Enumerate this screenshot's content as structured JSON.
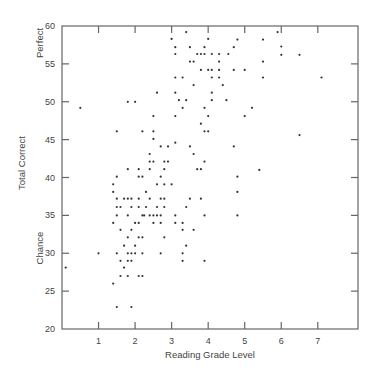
{
  "chart_data": {
    "type": "scatter",
    "title": "",
    "xlabel": "Reading Grade Level",
    "ylabel": "Total Correct",
    "y_annotations": [
      {
        "label": "Perfect",
        "y": 58
      },
      {
        "label": "Chance",
        "y": 30
      }
    ],
    "xlim": [
      0,
      8.1
    ],
    "ylim": [
      20,
      60
    ],
    "x_ticks": [
      1,
      2,
      3,
      4,
      5,
      6,
      7
    ],
    "y_ticks": [
      20,
      25,
      30,
      35,
      40,
      45,
      50,
      55,
      60
    ],
    "grid": false,
    "legend": null,
    "points": [
      [
        3.4,
        59.2
      ],
      [
        3.0,
        58.3
      ],
      [
        4.0,
        58.3
      ],
      [
        4.8,
        58.2
      ],
      [
        5.9,
        59.2
      ],
      [
        5.5,
        58.2
      ],
      [
        3.1,
        57.2
      ],
      [
        3.5,
        57.2
      ],
      [
        3.9,
        57.2
      ],
      [
        4.7,
        57.2
      ],
      [
        6.0,
        57.3
      ],
      [
        3.1,
        56.3
      ],
      [
        3.7,
        56.3
      ],
      [
        3.8,
        56.3
      ],
      [
        3.9,
        56.3
      ],
      [
        4.1,
        56.3
      ],
      [
        4.3,
        56.3
      ],
      [
        4.55,
        56.3
      ],
      [
        6.0,
        56.2
      ],
      [
        6.5,
        56.2
      ],
      [
        3.5,
        55.3
      ],
      [
        3.6,
        55.3
      ],
      [
        4.3,
        55.3
      ],
      [
        5.5,
        55.3
      ],
      [
        3.8,
        54.2
      ],
      [
        4.0,
        54.2
      ],
      [
        4.1,
        54.2
      ],
      [
        4.3,
        54.2
      ],
      [
        4.7,
        54.2
      ],
      [
        5.0,
        54.2
      ],
      [
        3.1,
        53.2
      ],
      [
        3.3,
        53.2
      ],
      [
        4.1,
        53.2
      ],
      [
        4.3,
        53.2
      ],
      [
        5.5,
        53.2
      ],
      [
        7.1,
        53.2
      ],
      [
        3.6,
        52.2
      ],
      [
        4.4,
        52.2
      ],
      [
        2.6,
        51.2
      ],
      [
        3.1,
        51.2
      ],
      [
        4.1,
        51.2
      ],
      [
        1.8,
        50.0
      ],
      [
        2.0,
        50.0
      ],
      [
        3.2,
        50.2
      ],
      [
        3.4,
        50.2
      ],
      [
        4.1,
        50.2
      ],
      [
        4.5,
        50.2
      ],
      [
        0.5,
        49.2
      ],
      [
        3.3,
        49.2
      ],
      [
        3.9,
        49.2
      ],
      [
        5.2,
        49.2
      ],
      [
        2.5,
        48.1
      ],
      [
        3.1,
        48.1
      ],
      [
        4.0,
        48.1
      ],
      [
        5.0,
        48.1
      ],
      [
        3.8,
        47.1
      ],
      [
        1.5,
        46.1
      ],
      [
        2.2,
        46.1
      ],
      [
        2.5,
        46.1
      ],
      [
        3.9,
        46.1
      ],
      [
        4.0,
        46.1
      ],
      [
        2.5,
        45.1
      ],
      [
        6.5,
        45.6
      ],
      [
        3.1,
        44.6
      ],
      [
        2.7,
        44.1
      ],
      [
        2.9,
        44.1
      ],
      [
        3.5,
        44.1
      ],
      [
        4.7,
        44.1
      ],
      [
        2.4,
        43.1
      ],
      [
        3.6,
        43.1
      ],
      [
        2.4,
        42.1
      ],
      [
        2.5,
        42.1
      ],
      [
        2.8,
        42.1
      ],
      [
        2.9,
        42.1
      ],
      [
        3.9,
        42.1
      ],
      [
        1.8,
        41.1
      ],
      [
        2.1,
        41.1
      ],
      [
        2.4,
        41.1
      ],
      [
        2.8,
        41.1
      ],
      [
        3.7,
        41.1
      ],
      [
        3.8,
        41.1
      ],
      [
        5.4,
        41.0
      ],
      [
        1.5,
        40.1
      ],
      [
        2.1,
        40.1
      ],
      [
        2.2,
        40.1
      ],
      [
        2.7,
        40.1
      ],
      [
        4.8,
        40.1
      ],
      [
        1.4,
        39.1
      ],
      [
        2.6,
        39.1
      ],
      [
        2.8,
        39.1
      ],
      [
        3.0,
        39.1
      ],
      [
        1.4,
        38.1
      ],
      [
        2.3,
        38.1
      ],
      [
        4.8,
        38.1
      ],
      [
        1.5,
        37.2
      ],
      [
        1.7,
        37.2
      ],
      [
        1.8,
        37.2
      ],
      [
        1.9,
        37.2
      ],
      [
        2.1,
        37.2
      ],
      [
        2.4,
        37.2
      ],
      [
        2.7,
        37.2
      ],
      [
        2.8,
        37.2
      ],
      [
        3.5,
        37.2
      ],
      [
        3.8,
        37.2
      ],
      [
        1.5,
        36.1
      ],
      [
        1.6,
        36.1
      ],
      [
        1.9,
        36.1
      ],
      [
        2.1,
        36.1
      ],
      [
        2.3,
        36.1
      ],
      [
        2.6,
        36.1
      ],
      [
        2.8,
        36.1
      ],
      [
        3.4,
        36.1
      ],
      [
        1.5,
        35.0
      ],
      [
        1.8,
        35.0
      ],
      [
        2.2,
        35.0
      ],
      [
        2.25,
        35.0
      ],
      [
        2.4,
        35.0
      ],
      [
        2.5,
        35.0
      ],
      [
        2.6,
        35.0
      ],
      [
        2.7,
        35.0
      ],
      [
        3.1,
        35.0
      ],
      [
        3.9,
        35.0
      ],
      [
        4.8,
        35.0
      ],
      [
        1.4,
        34.0
      ],
      [
        2.0,
        34.0
      ],
      [
        2.1,
        34.0
      ],
      [
        2.5,
        34.0
      ],
      [
        2.7,
        34.0
      ],
      [
        3.1,
        34.0
      ],
      [
        3.3,
        34.0
      ],
      [
        1.6,
        33.1
      ],
      [
        1.9,
        33.1
      ],
      [
        3.3,
        33.1
      ],
      [
        3.6,
        33.1
      ],
      [
        1.8,
        32.1
      ],
      [
        2.1,
        32.1
      ],
      [
        2.2,
        32.1
      ],
      [
        2.8,
        32.1
      ],
      [
        1.7,
        31.0
      ],
      [
        2.0,
        31.0
      ],
      [
        3.4,
        31.0
      ],
      [
        1.0,
        30.0
      ],
      [
        1.5,
        30.0
      ],
      [
        1.8,
        30.0
      ],
      [
        1.9,
        30.0
      ],
      [
        2.0,
        30.0
      ],
      [
        2.2,
        30.0
      ],
      [
        2.7,
        30.0
      ],
      [
        3.3,
        30.0
      ],
      [
        1.6,
        29.0
      ],
      [
        1.8,
        29.0
      ],
      [
        1.9,
        29.0
      ],
      [
        3.3,
        29.0
      ],
      [
        3.9,
        29.0
      ],
      [
        0.1,
        28.1
      ],
      [
        1.7,
        28.1
      ],
      [
        1.6,
        27.0
      ],
      [
        1.8,
        27.0
      ],
      [
        2.1,
        27.0
      ],
      [
        2.2,
        27.0
      ],
      [
        1.4,
        26.0
      ],
      [
        1.5,
        22.9
      ],
      [
        1.9,
        22.9
      ]
    ]
  }
}
